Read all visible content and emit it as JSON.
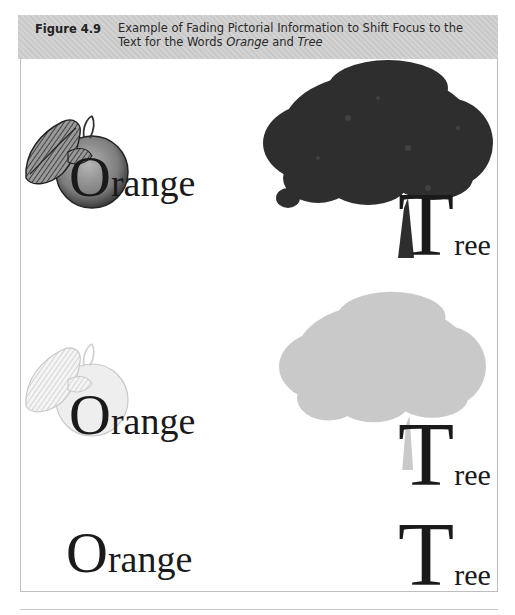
{
  "figure": {
    "label": "Figure 4.9",
    "caption_part1": "Example of Fading Pictorial Information to Shift Focus to the Text for the Words ",
    "caption_em1": "Orange",
    "caption_mid": " and ",
    "caption_em2": "Tree"
  },
  "rows": [
    {
      "stage": "full-picture",
      "orange": {
        "initial": "O",
        "rest": "range",
        "image": "orange-illustration",
        "opacity": 1.0
      },
      "tree": {
        "initial": "T",
        "rest": "ree",
        "image": "tree-photo",
        "opacity": 1.0
      }
    },
    {
      "stage": "faded-picture",
      "orange": {
        "initial": "O",
        "rest": "range",
        "image": "orange-illustration",
        "opacity": 0.35
      },
      "tree": {
        "initial": "T",
        "rest": "ree",
        "image": "tree-photo",
        "opacity": 0.3
      }
    },
    {
      "stage": "text-only",
      "orange": {
        "initial": "O",
        "rest": "range"
      },
      "tree": {
        "initial": "T",
        "rest": "ree"
      }
    }
  ],
  "colors": {
    "header_bg": "#cfcfcf",
    "frame_border": "#bdbdbd",
    "text": "#1a1a1a",
    "tree_dark": "#2e2e2e",
    "tree_faded": "#bdbdbd",
    "orange_fill": "#8a8a8a"
  }
}
